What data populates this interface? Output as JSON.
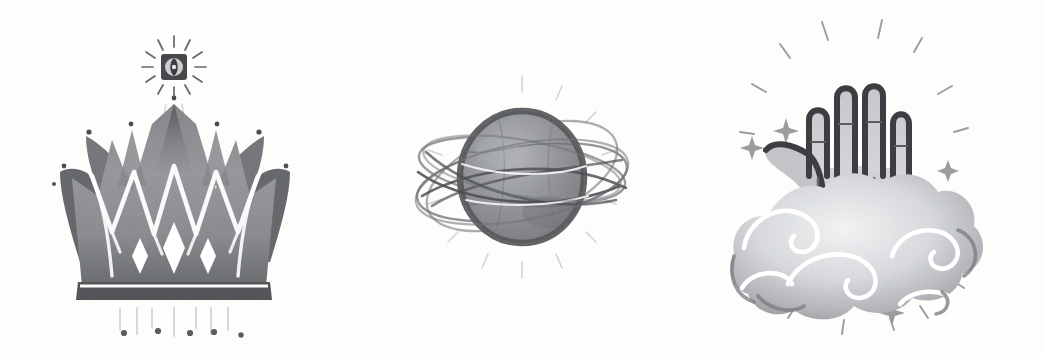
{
  "artwork": {
    "title": "Three Mystical Ink Illustrations",
    "medium": "grayscale ink and wash drawing",
    "background_color": "#fdfdfc",
    "ink_dark": "#3b3b3d",
    "ink_mid": "#7e8084",
    "ink_light": "#b7b9bc",
    "ink_pale": "#d8dadd",
    "highlight_color": "#ffffff",
    "panel_count": 3
  },
  "panels": [
    {
      "id": "crown",
      "name": "radiant-crown",
      "label": "Crown with Radiant Eye",
      "center_x": 174,
      "center_y": 190,
      "elements": [
        {
          "name": "radiant-eye-icon",
          "label": "Radiant Eye",
          "ray_count": 12,
          "cx": 174,
          "cy": 67,
          "radius": 13
        },
        {
          "name": "crown-body",
          "label": "Crown",
          "spike_count": 9
        },
        {
          "name": "crown-zigzag-highlight",
          "label": "Zigzag Highlight",
          "peak_count": 4
        },
        {
          "name": "crown-band",
          "label": "Crown Band"
        },
        {
          "name": "crown-diamonds",
          "label": "Band Diamonds",
          "count": 3
        },
        {
          "name": "crown-tip-dots",
          "label": "Spike Tip Dots",
          "count": 8
        },
        {
          "name": "crown-rain-lines",
          "label": "Descending Lines",
          "count": 7
        },
        {
          "name": "crown-bottom-dots",
          "label": "Bottom Dots",
          "count": 5
        }
      ]
    },
    {
      "id": "planet",
      "name": "orbited-planet",
      "label": "Planet with Orbital Rings",
      "center_x": 522,
      "center_y": 177,
      "elements": [
        {
          "name": "planet-sphere",
          "label": "Planet Sphere",
          "cx": 522,
          "cy": 177,
          "rx": 62,
          "ry": 66
        },
        {
          "name": "orbit-rings",
          "label": "Orbit Rings",
          "count": 5
        },
        {
          "name": "planet-rays",
          "label": "Radiating Rays",
          "count": 12
        }
      ]
    },
    {
      "id": "hand",
      "name": "hand-in-clouds",
      "label": "Hand Rising from Clouds",
      "center_x": 880,
      "center_y": 180,
      "elements": [
        {
          "name": "hand-shape",
          "label": "Open Hand",
          "finger_count": 4
        },
        {
          "name": "thumb",
          "label": "Thumb"
        },
        {
          "name": "cloud-shape",
          "label": "Stylized Cloud",
          "lobe_count": 6
        },
        {
          "name": "cloud-swirls",
          "label": "Cloud Swirls",
          "count": 5
        },
        {
          "name": "sparkle-stars",
          "label": "Four-Point Sparkles",
          "count": 4
        },
        {
          "name": "radiating-dashes",
          "label": "Radiating Dashes",
          "count": 14
        }
      ]
    }
  ]
}
